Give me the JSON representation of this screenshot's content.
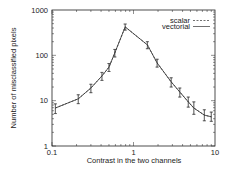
{
  "chart_data": {
    "type": "line",
    "title": "",
    "xlabel": "Contrast in the two channels",
    "ylabel": "Number of misclassified pixels",
    "xscale": "log",
    "yscale": "log",
    "xlim": [
      0.1,
      10
    ],
    "ylim": [
      1,
      1000
    ],
    "x_ticks": [
      {
        "v": 0.1,
        "label": "0.1"
      },
      {
        "v": 1,
        "label": "1"
      },
      {
        "v": 10,
        "label": "10"
      }
    ],
    "y_ticks": [
      {
        "v": 1,
        "label": "1"
      },
      {
        "v": 10,
        "label": "10"
      },
      {
        "v": 100,
        "label": "100"
      },
      {
        "v": 1000,
        "label": "1000"
      }
    ],
    "grid": false,
    "legend_position": "upper right",
    "x": [
      0.11,
      0.21,
      0.3,
      0.41,
      0.5,
      0.59,
      0.79,
      1.48,
      1.95,
      2.9,
      3.7,
      4.7,
      5.5,
      7.4,
      9.0
    ],
    "series": [
      {
        "name": "scalar",
        "style": "dashed",
        "values": [
          6.9,
          11,
          19,
          35,
          55,
          113,
          424,
          170,
          68,
          26,
          15.5,
          9.4,
          6.9,
          4.8,
          4.4
        ],
        "err_low": [
          5.2,
          8.6,
          15,
          28,
          44,
          92,
          360,
          140,
          55,
          20,
          12,
          7.2,
          5.0,
          3.6,
          3.5
        ],
        "err_high": [
          8.5,
          13.5,
          23,
          42,
          66,
          135,
          490,
          200,
          82,
          32,
          19,
          12,
          9.4,
          6.3,
          5.6
        ]
      },
      {
        "name": "vectorial",
        "style": "solid",
        "values": [
          6.9,
          11,
          19,
          35,
          55,
          113,
          424,
          170,
          68,
          26,
          15.5,
          9.4,
          6.9,
          4.8,
          4.4
        ],
        "err_low": [
          5.2,
          8.6,
          15,
          28,
          44,
          92,
          360,
          140,
          55,
          20,
          12,
          7.2,
          5.0,
          3.6,
          3.5
        ],
        "err_high": [
          8.5,
          13.5,
          23,
          42,
          66,
          135,
          490,
          200,
          82,
          32,
          19,
          12,
          9.4,
          6.3,
          5.6
        ]
      }
    ]
  },
  "legend": {
    "scalar": "scalar",
    "vectorial": "vectorial"
  }
}
